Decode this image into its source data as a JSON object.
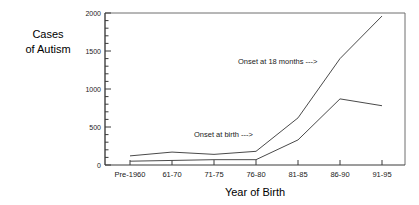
{
  "chart_data": {
    "type": "line",
    "title": "",
    "xlabel": "Year of Birth",
    "ylabel": "Cases of Autism",
    "ylabel_line1": "Cases",
    "ylabel_line2": "of Autism",
    "categories": [
      "Pre-1960",
      "61-70",
      "71-75",
      "76-80",
      "81-85",
      "86-90",
      "91-95"
    ],
    "yticks": [
      0,
      500,
      1000,
      1500,
      2000
    ],
    "ytick_labels": [
      "0",
      "500",
      "1000",
      "1500",
      "2000"
    ],
    "ylim": [
      0,
      2000
    ],
    "minor_ticks_per_interval": 5,
    "grid": false,
    "legend_position": "inline-annotation",
    "series": [
      {
        "name": "Onset at 18 months",
        "values": [
          120,
          170,
          140,
          180,
          620,
          1400,
          1960
        ],
        "color": "#4a4a4a"
      },
      {
        "name": "Onset at birth",
        "values": [
          50,
          60,
          70,
          70,
          330,
          870,
          780
        ],
        "color": "#4a4a4a"
      }
    ],
    "annotations": [
      {
        "text": "Onset at 18 months --->",
        "label": "Onset at 18 months",
        "arrow": "--->",
        "x_px": 238,
        "y_px": 64
      },
      {
        "text": "Onset at birth --->",
        "label": "Onset at birth",
        "arrow": "--->",
        "x_px": 194,
        "y_px": 137
      }
    ]
  }
}
